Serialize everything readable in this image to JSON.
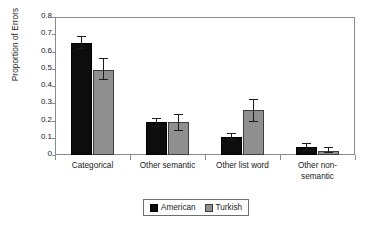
{
  "chart_data": {
    "type": "bar",
    "title": "",
    "xlabel": "",
    "ylabel": "Proportion of Errors",
    "ylim": [
      0,
      0.8
    ],
    "yticks": [
      "0",
      "0.1",
      "0.2",
      "0.3",
      "0.4",
      "0.5",
      "0.6",
      "0.7",
      "0.8"
    ],
    "ytick_values": [
      0,
      0.1,
      0.2,
      0.3,
      0.4,
      0.5,
      0.6,
      0.7,
      0.8
    ],
    "grid": false,
    "legend_position": "bottom-center",
    "categories": [
      "Categorical",
      "Other semantic",
      "Other list word",
      "Other non-semantic"
    ],
    "category_lines": [
      [
        "Categorical"
      ],
      [
        "Other semantic"
      ],
      [
        "Other list word"
      ],
      [
        "Other non-",
        "semantic"
      ]
    ],
    "series": [
      {
        "name": "American",
        "color": "#0d0d0d",
        "values": [
          0.65,
          0.19,
          0.105,
          0.045
        ],
        "errors_low": [
          0.615,
          0.165,
          0.085,
          0.025
        ],
        "errors_high": [
          0.69,
          0.215,
          0.125,
          0.07
        ]
      },
      {
        "name": "Turkish",
        "color": "#8f8f8f",
        "values": [
          0.495,
          0.19,
          0.26,
          0.025
        ],
        "errors_low": [
          0.435,
          0.14,
          0.19,
          0.01
        ],
        "errors_high": [
          0.565,
          0.24,
          0.325,
          0.045
        ]
      }
    ]
  },
  "legend": {
    "entries": [
      {
        "label": "American",
        "swatch": "american"
      },
      {
        "label": "Turkish",
        "swatch": "turkish"
      }
    ]
  }
}
